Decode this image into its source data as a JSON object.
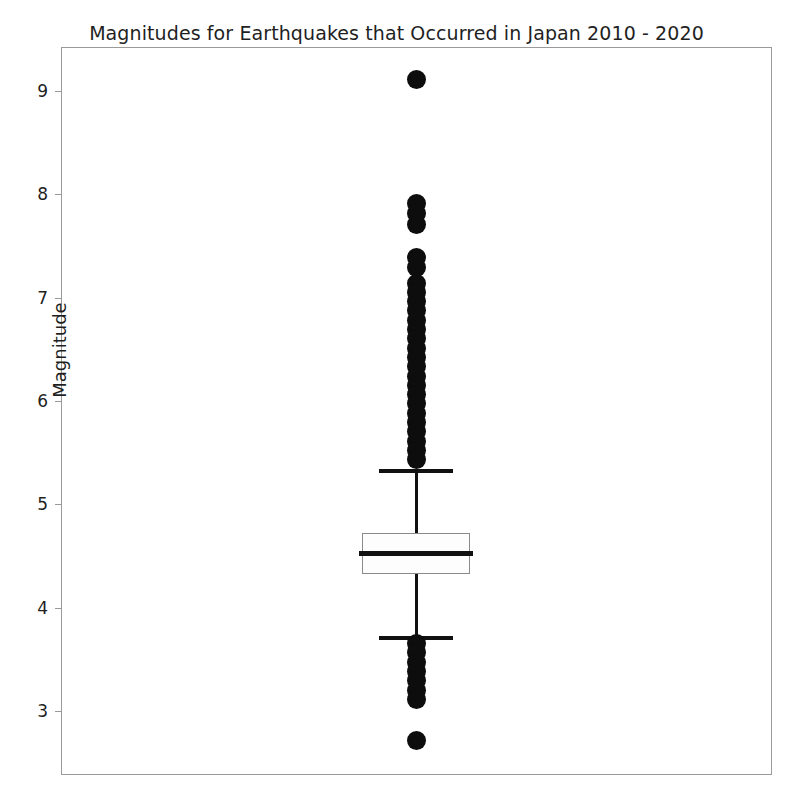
{
  "chart": {
    "title": "Magnitudes for Earthquakes that Occurred in Japan 2010 - 2020",
    "ylabel": "Magnitude",
    "xlabel": ""
  },
  "chart_data": {
    "type": "box",
    "title": "Magnitudes for Earthquakes that Occurred in Japan 2010 - 2020",
    "xlabel": "",
    "ylabel": "Magnitude",
    "ylim": [
      2.55,
      9.35
    ],
    "yticks": [
      3,
      4,
      5,
      6,
      7,
      8,
      9
    ],
    "ytick_labels": [
      "3",
      "4",
      "5",
      "6",
      "7",
      "8",
      "9"
    ],
    "grid": false,
    "legend": null,
    "orientation": "vertical",
    "box_color": "#fdfdfd",
    "line_color": "#111111",
    "outlier_color": "#0d0d0d",
    "categories": [
      "Japan 2010 - 2020"
    ],
    "boxes": [
      {
        "label": "Japan 2010 - 2020",
        "min_whisker": 3.71,
        "q1": 4.33,
        "median": 4.53,
        "q3": 4.73,
        "max_whisker": 5.33,
        "iqr": 0.4,
        "outliers_high": [
          9.12,
          7.92,
          7.82,
          7.72,
          7.4,
          7.3,
          7.15,
          7.06,
          6.97,
          6.88,
          6.79,
          6.7,
          6.61,
          6.52,
          6.43,
          6.34,
          6.25,
          6.16,
          6.07,
          5.98,
          5.89,
          5.8,
          5.71,
          5.62,
          5.53,
          5.44
        ],
        "outliers_low": [
          3.66,
          3.57,
          3.48,
          3.39,
          3.3,
          3.21,
          3.12,
          2.72
        ]
      }
    ]
  },
  "axes": {
    "y_ticks": [
      {
        "value": 9,
        "label": "9"
      },
      {
        "value": 8,
        "label": "8"
      },
      {
        "value": 7,
        "label": "7"
      },
      {
        "value": 6,
        "label": "6"
      },
      {
        "value": 5,
        "label": "5"
      },
      {
        "value": 4,
        "label": "4"
      },
      {
        "value": 3,
        "label": "3"
      }
    ]
  },
  "geometry": {
    "plot_left": 61,
    "plot_top": 47,
    "plot_width": 711,
    "plot_height": 728,
    "box_center_x": 416,
    "box_half_width": 54,
    "whisker_cap_half_width": 37,
    "outlier_radius": 9.5,
    "y_value_at_tick9": 92,
    "px_per_unit": 103.3
  }
}
